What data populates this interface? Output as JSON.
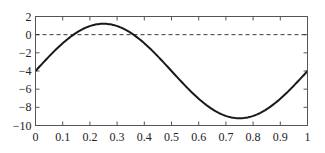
{
  "chart_data": {
    "type": "line",
    "title": "",
    "xlabel": "",
    "ylabel": "",
    "xlim": [
      0,
      1
    ],
    "ylim": [
      -10,
      2
    ],
    "grid": false,
    "legend": null,
    "x_ticks": [
      "0",
      "0.1",
      "0.2",
      "0.3",
      "0.4",
      "0.5",
      "0.6",
      "0.7",
      "0.8",
      "0.9",
      "1"
    ],
    "y_ticks": [
      "2",
      "0",
      "−2",
      "−4",
      "−6",
      "−8",
      "−10"
    ],
    "series": [
      {
        "name": "curve",
        "style": "solid",
        "color": "#1a1a1a",
        "formula": "y = 5.2*sin(2*pi*x) - 4",
        "x": [
          0,
          0.05,
          0.1,
          0.15,
          0.2,
          0.25,
          0.3,
          0.35,
          0.4,
          0.45,
          0.5,
          0.55,
          0.6,
          0.65,
          0.7,
          0.75,
          0.8,
          0.85,
          0.9,
          0.95,
          1
        ],
        "y": [
          -4,
          -2.39,
          -0.94,
          0.21,
          0.95,
          1.2,
          0.95,
          0.21,
          -0.94,
          -2.39,
          -4,
          -5.61,
          -7.06,
          -8.21,
          -8.95,
          -9.2,
          -8.95,
          -8.21,
          -7.06,
          -5.61,
          -4
        ]
      },
      {
        "name": "zero-line",
        "style": "dashed",
        "color": "#1a1a1a",
        "x": [
          0,
          1
        ],
        "y": [
          0,
          0
        ]
      }
    ]
  }
}
